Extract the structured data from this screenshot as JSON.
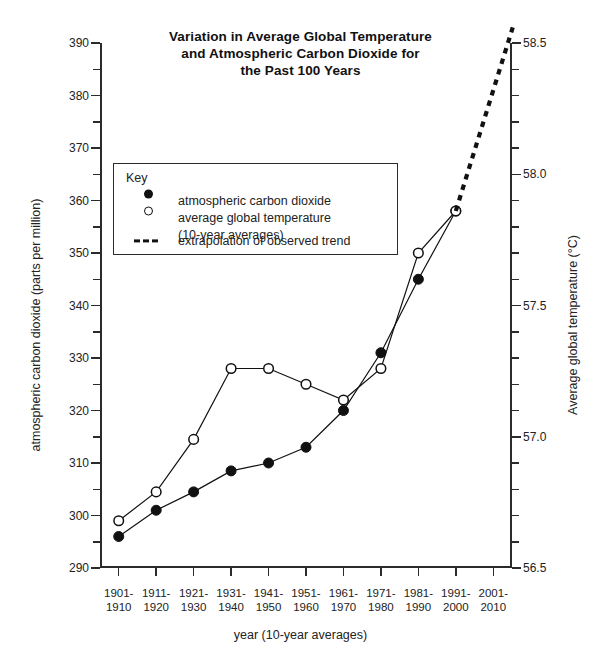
{
  "title_lines": [
    "Variation in Average Global Temperature",
    "and Atmospheric Carbon Dioxide for",
    "the Past 100 Years"
  ],
  "axes": {
    "y_left_title": "atmospheric carbon dioxide (parts per million)",
    "y_right_title": "Average global temperature (°C)",
    "x_title": "year (10-year averages)"
  },
  "key": {
    "heading": "Key",
    "items": [
      {
        "marker": "filled-circle",
        "label": "atmospheric carbon dioxide"
      },
      {
        "marker": "open-circle",
        "label": "average global temperature",
        "sublabel": "(10-year averages)"
      },
      {
        "marker": "dashed-line",
        "label": "extrapolation of observed trend"
      }
    ]
  },
  "chart_data": {
    "type": "line",
    "title": "Variation in Average Global Temperature and Atmospheric Carbon Dioxide for the Past 100 Years",
    "xlabel": "year (10-year averages)",
    "ylabel": "atmospheric carbon dioxide (parts per million)",
    "y2label": "Average global temperature (°C)",
    "grid": false,
    "legend_position": "inside-upper-left",
    "categories": [
      "1901-1910",
      "1911-1920",
      "1921-1930",
      "1931-1940",
      "1941-1950",
      "1951-1960",
      "1961-1970",
      "1971-1980",
      "1981-1990",
      "1991-2000",
      "2001-2010"
    ],
    "x_tick_labels": [
      [
        "1901-",
        "1910"
      ],
      [
        "1911-",
        "1920"
      ],
      [
        "1921-",
        "1930"
      ],
      [
        "1931-",
        "1940"
      ],
      [
        "1941-",
        "1950"
      ],
      [
        "1951-",
        "1960"
      ],
      [
        "1961-",
        "1970"
      ],
      [
        "1971-",
        "1980"
      ],
      [
        "1981-",
        "1990"
      ],
      [
        "1991-",
        "2000"
      ],
      [
        "2001-",
        "2010"
      ]
    ],
    "ylim": [
      290,
      390
    ],
    "y_ticks": [
      290,
      300,
      310,
      320,
      330,
      340,
      350,
      360,
      370,
      380,
      390
    ],
    "y_minor_step": 5,
    "y2lim": [
      56.5,
      58.5
    ],
    "y2_ticks": [
      56.5,
      57.0,
      57.5,
      58.0,
      58.5
    ],
    "y2_tick_labels": [
      "56.5",
      "57.0",
      "57.5",
      "58.0",
      "58.5"
    ],
    "y2_minor_step": 0.1,
    "series": [
      {
        "name": "atmospheric carbon dioxide",
        "axis": "left",
        "unit": "ppm",
        "marker": "filled-circle",
        "linestyle": "solid",
        "color": "#111111",
        "values": [
          296,
          301,
          304.5,
          308.5,
          310,
          313,
          320,
          331,
          345,
          358,
          null
        ]
      },
      {
        "name": "average global temperature (10-year averages)",
        "axis": "right",
        "unit": "°C",
        "marker": "open-circle",
        "linestyle": "solid",
        "color": "#111111",
        "values": [
          56.68,
          56.79,
          57.0,
          57.26,
          57.26,
          57.2,
          57.14,
          57.26,
          57.7,
          57.86,
          null
        ],
        "values_on_left_scale": [
          299,
          304.5,
          314.5,
          328,
          328,
          325,
          322,
          328,
          350,
          358,
          null
        ]
      },
      {
        "name": "extrapolation of observed trend",
        "axis": "both",
        "marker": "none",
        "linestyle": "dashed",
        "color": "#111111",
        "from_category": "1991-2000",
        "values_on_left_scale": [
          null,
          null,
          null,
          null,
          null,
          null,
          null,
          null,
          null,
          358,
          381
        ],
        "end_value_left_scale": 388,
        "end_value_right_scale": 58.44
      }
    ]
  }
}
